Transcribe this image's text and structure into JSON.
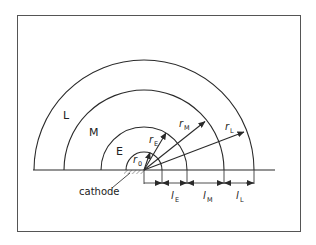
{
  "diagram": {
    "type": "concentric-shell-schematic",
    "shells": [
      {
        "name": "L",
        "label": "L",
        "radius_symbol": "r",
        "radius_sub": "L",
        "length_symbol": "l",
        "length_sub": "L"
      },
      {
        "name": "M",
        "label": "M",
        "radius_symbol": "r",
        "radius_sub": "M",
        "length_symbol": "l",
        "length_sub": "M"
      },
      {
        "name": "E",
        "label": "E",
        "radius_symbol": "r",
        "radius_sub": "E",
        "length_symbol": "l",
        "length_sub": "E"
      }
    ],
    "core": {
      "radius_symbol": "r",
      "radius_sub": "0"
    },
    "cathode_label": "cathode",
    "colors": {
      "stroke": "#2a2a2a",
      "background": "#ffffff",
      "frame": "#555555"
    }
  }
}
